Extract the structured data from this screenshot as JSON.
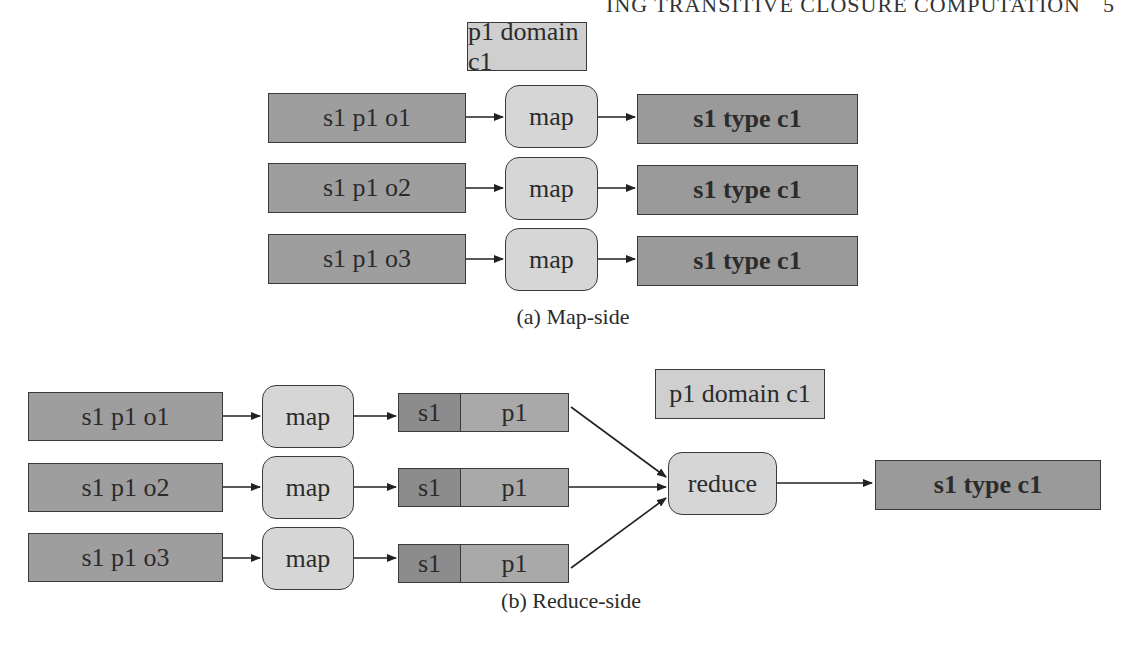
{
  "header": {
    "running_title": "ING TRANSITIVE CLOSURE COMPUTATION",
    "page_number": "5"
  },
  "figure_a": {
    "caption": "(a) Map-side",
    "schema_triple": "p1 domain c1",
    "rows": [
      {
        "input": "s1 p1 o1",
        "function": "map",
        "output": "s1 type c1"
      },
      {
        "input": "s1 p1 o2",
        "function": "map",
        "output": "s1 type c1"
      },
      {
        "input": "s1 p1 o3",
        "function": "map",
        "output": "s1 type c1"
      }
    ]
  },
  "figure_b": {
    "caption": "(b) Reduce-side",
    "schema_triple": "p1 domain c1",
    "rows": [
      {
        "input": "s1 p1 o1",
        "function": "map",
        "key": "s1",
        "value": "p1"
      },
      {
        "input": "s1 p1 o2",
        "function": "map",
        "key": "s1",
        "value": "p1"
      },
      {
        "input": "s1 p1 o3",
        "function": "map",
        "key": "s1",
        "value": "p1"
      }
    ],
    "reducer": "reduce",
    "output": "s1 type c1"
  },
  "colors": {
    "triple_fill": "#9e9e9e",
    "function_fill": "#d6d6d6",
    "domain_fill": "#cfcfcf",
    "key_fill": "#8c8c8c",
    "value_fill": "#a9a9a9",
    "stroke": "#3a3a3a"
  }
}
